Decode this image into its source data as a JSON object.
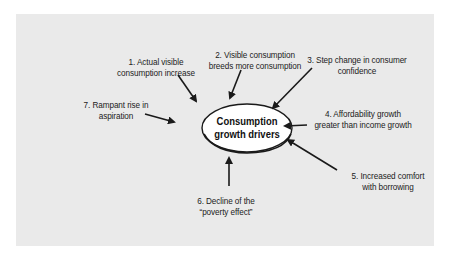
{
  "diagram": {
    "center": {
      "line1": "Consumption",
      "line2": "growth drivers"
    },
    "drivers": [
      {
        "line1": "1. Actual visible",
        "line2": "consumption increase"
      },
      {
        "line1": "2. Visible consumption",
        "line2": "breeds more consumption"
      },
      {
        "line1": "3. Step change in consumer",
        "line2": "confidence"
      },
      {
        "line1": "4. Affordability growth",
        "line2": "greater than income growth"
      },
      {
        "line1": "5. Increased comfort",
        "line2": "with borrowing"
      },
      {
        "line1": "6. Decline of the",
        "line2": "“poverty effect”"
      },
      {
        "line1": "7. Rampant rise in",
        "line2": "aspiration"
      }
    ],
    "colors": {
      "background": "#eaeaea",
      "ellipse_fill": "#ffffff",
      "stroke": "#1a1a1a",
      "text": "#222222"
    }
  }
}
